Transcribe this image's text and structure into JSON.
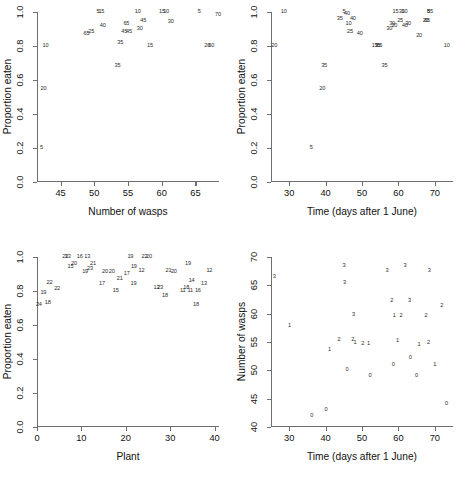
{
  "figure": {
    "panel_count": 4,
    "background": "#ffffff",
    "axis_color": "#6e6e6e",
    "text_color": "#111111",
    "marker_color": "#2b2b2b"
  },
  "chart_data": [
    {
      "id": "panel-1",
      "type": "scatter",
      "title": "",
      "xlabel": "Number of wasps",
      "ylabel": "Proportion eaten",
      "xlim": [
        41.5,
        68.5
      ],
      "ylim": [
        0.0,
        1.0
      ],
      "xticks": [
        45,
        50,
        55,
        60,
        65
      ],
      "yticks": [
        "0.0",
        "0.2",
        "0.4",
        "0.6",
        "0.8",
        "1.0"
      ],
      "grid": false,
      "legend": "none",
      "marker_style": "text-label",
      "note": "each point is drawn as its text label (plant/time code)",
      "points": [
        {
          "x": 42.0,
          "y": 0.2,
          "label": "5"
        },
        {
          "x": 42.3,
          "y": 0.55,
          "label": "20"
        },
        {
          "x": 42.6,
          "y": 0.8,
          "label": "10"
        },
        {
          "x": 48.7,
          "y": 0.87,
          "label": "65"
        },
        {
          "x": 49.4,
          "y": 0.88,
          "label": "25"
        },
        {
          "x": 50.4,
          "y": 1.0,
          "label": "5"
        },
        {
          "x": 50.9,
          "y": 1.0,
          "label": "15"
        },
        {
          "x": 51.1,
          "y": 0.92,
          "label": "40"
        },
        {
          "x": 53.3,
          "y": 0.68,
          "label": "35"
        },
        {
          "x": 53.7,
          "y": 0.82,
          "label": "35"
        },
        {
          "x": 54.3,
          "y": 0.88,
          "label": "45"
        },
        {
          "x": 54.6,
          "y": 0.93,
          "label": "65"
        },
        {
          "x": 55.0,
          "y": 0.88,
          "label": "45"
        },
        {
          "x": 56.3,
          "y": 1.0,
          "label": "10"
        },
        {
          "x": 56.6,
          "y": 0.9,
          "label": "30"
        },
        {
          "x": 57.1,
          "y": 0.95,
          "label": "45"
        },
        {
          "x": 58.1,
          "y": 0.8,
          "label": "15"
        },
        {
          "x": 59.9,
          "y": 1.0,
          "label": "15"
        },
        {
          "x": 60.5,
          "y": 1.0,
          "label": "10"
        },
        {
          "x": 61.2,
          "y": 0.94,
          "label": "30"
        },
        {
          "x": 65.4,
          "y": 1.0,
          "label": "5"
        },
        {
          "x": 66.6,
          "y": 0.8,
          "label": "20"
        },
        {
          "x": 67.2,
          "y": 0.8,
          "label": "60"
        },
        {
          "x": 68.2,
          "y": 0.98,
          "label": "70"
        }
      ]
    },
    {
      "id": "panel-2",
      "type": "scatter",
      "title": "",
      "xlabel": "Time (days after 1 June)",
      "ylabel": "Proportion eaten",
      "xlim": [
        25,
        75
      ],
      "ylim": [
        0.0,
        1.0
      ],
      "xticks": [
        30,
        40,
        50,
        60,
        70
      ],
      "yticks": [
        "0.0",
        "0.2",
        "0.4",
        "0.6",
        "0.8",
        "1.0"
      ],
      "grid": false,
      "legend": "none",
      "marker_style": "text-label",
      "points": [
        {
          "x": 25.6,
          "y": 0.8,
          "label": "20"
        },
        {
          "x": 28.2,
          "y": 1.0,
          "label": "10"
        },
        {
          "x": 35.8,
          "y": 0.2,
          "label": "5"
        },
        {
          "x": 38.8,
          "y": 0.55,
          "label": "20"
        },
        {
          "x": 39.3,
          "y": 0.68,
          "label": "35"
        },
        {
          "x": 43.6,
          "y": 0.96,
          "label": "35"
        },
        {
          "x": 44.8,
          "y": 1.0,
          "label": "5"
        },
        {
          "x": 45.6,
          "y": 0.99,
          "label": "40"
        },
        {
          "x": 46.0,
          "y": 0.93,
          "label": "10"
        },
        {
          "x": 46.4,
          "y": 0.88,
          "label": "25"
        },
        {
          "x": 47.2,
          "y": 0.96,
          "label": "40"
        },
        {
          "x": 49.1,
          "y": 0.87,
          "label": "40"
        },
        {
          "x": 53.2,
          "y": 0.8,
          "label": "15"
        },
        {
          "x": 54.0,
          "y": 0.8,
          "label": "35"
        },
        {
          "x": 54.5,
          "y": 0.8,
          "label": "65"
        },
        {
          "x": 55.9,
          "y": 0.68,
          "label": "35"
        },
        {
          "x": 57.2,
          "y": 0.9,
          "label": "30"
        },
        {
          "x": 58.0,
          "y": 0.93,
          "label": "30"
        },
        {
          "x": 58.6,
          "y": 0.92,
          "label": "20"
        },
        {
          "x": 58.9,
          "y": 1.0,
          "label": "15"
        },
        {
          "x": 60.2,
          "y": 0.95,
          "label": "25"
        },
        {
          "x": 60.6,
          "y": 1.0,
          "label": "30"
        },
        {
          "x": 61.4,
          "y": 1.0,
          "label": "10"
        },
        {
          "x": 61.5,
          "y": 0.92,
          "label": "40"
        },
        {
          "x": 62.4,
          "y": 0.93,
          "label": "30"
        },
        {
          "x": 65.4,
          "y": 0.86,
          "label": "20"
        },
        {
          "x": 67.2,
          "y": 0.95,
          "label": "20"
        },
        {
          "x": 67.6,
          "y": 0.95,
          "label": "65"
        },
        {
          "x": 68.0,
          "y": 1.0,
          "label": "5"
        },
        {
          "x": 68.4,
          "y": 1.0,
          "label": "85"
        },
        {
          "x": 73.0,
          "y": 0.8,
          "label": "10"
        }
      ]
    },
    {
      "id": "panel-3",
      "type": "scatter",
      "title": "",
      "xlabel": "Plant",
      "ylabel": "Proportion eaten",
      "xlim": [
        0,
        41
      ],
      "ylim": [
        0.0,
        1.0
      ],
      "xticks": [
        0,
        10,
        20,
        30,
        40
      ],
      "yticks": [
        "0.0",
        "0.2",
        "0.4",
        "0.6",
        "0.8",
        "1.0"
      ],
      "grid": false,
      "legend": "none",
      "marker_style": "text-label",
      "points": [
        {
          "x": 0.2,
          "y": 0.72,
          "label": "24"
        },
        {
          "x": 1.2,
          "y": 0.79,
          "label": "19"
        },
        {
          "x": 2.2,
          "y": 0.73,
          "label": "18"
        },
        {
          "x": 2.6,
          "y": 0.85,
          "label": "22"
        },
        {
          "x": 4.3,
          "y": 0.81,
          "label": "22"
        },
        {
          "x": 6.1,
          "y": 1.0,
          "label": "23"
        },
        {
          "x": 6.7,
          "y": 1.0,
          "label": "13"
        },
        {
          "x": 7.3,
          "y": 0.94,
          "label": "15"
        },
        {
          "x": 8.1,
          "y": 0.96,
          "label": "20"
        },
        {
          "x": 9.4,
          "y": 1.0,
          "label": "16"
        },
        {
          "x": 11.1,
          "y": 1.0,
          "label": "13"
        },
        {
          "x": 10.6,
          "y": 0.91,
          "label": "19"
        },
        {
          "x": 11.7,
          "y": 0.93,
          "label": "23"
        },
        {
          "x": 12.4,
          "y": 0.96,
          "label": "21"
        },
        {
          "x": 14.4,
          "y": 0.84,
          "label": "17"
        },
        {
          "x": 15.1,
          "y": 0.91,
          "label": "20"
        },
        {
          "x": 16.6,
          "y": 0.91,
          "label": "20"
        },
        {
          "x": 17.5,
          "y": 0.8,
          "label": "15"
        },
        {
          "x": 18.4,
          "y": 0.87,
          "label": "21"
        },
        {
          "x": 20.0,
          "y": 0.9,
          "label": "17"
        },
        {
          "x": 20.8,
          "y": 1.0,
          "label": "19"
        },
        {
          "x": 21.6,
          "y": 0.94,
          "label": "19"
        },
        {
          "x": 21.5,
          "y": 0.84,
          "label": "19"
        },
        {
          "x": 23.3,
          "y": 0.92,
          "label": "12"
        },
        {
          "x": 24.0,
          "y": 1.0,
          "label": "22"
        },
        {
          "x": 25.0,
          "y": 1.0,
          "label": "20"
        },
        {
          "x": 26.7,
          "y": 0.82,
          "label": "12"
        },
        {
          "x": 27.5,
          "y": 0.82,
          "label": "23"
        },
        {
          "x": 28.6,
          "y": 0.77,
          "label": "18"
        },
        {
          "x": 29.4,
          "y": 0.92,
          "label": "21"
        },
        {
          "x": 30.6,
          "y": 0.91,
          "label": "20"
        },
        {
          "x": 32.6,
          "y": 0.8,
          "label": "11"
        },
        {
          "x": 33.4,
          "y": 0.82,
          "label": "18"
        },
        {
          "x": 33.8,
          "y": 0.96,
          "label": "19"
        },
        {
          "x": 34.3,
          "y": 0.8,
          "label": "11"
        },
        {
          "x": 34.6,
          "y": 0.86,
          "label": "14"
        },
        {
          "x": 35.6,
          "y": 0.72,
          "label": "18"
        },
        {
          "x": 36.0,
          "y": 0.8,
          "label": "16"
        },
        {
          "x": 37.4,
          "y": 0.84,
          "label": "13"
        },
        {
          "x": 38.6,
          "y": 0.92,
          "label": "12"
        }
      ]
    },
    {
      "id": "panel-4",
      "type": "scatter",
      "title": "",
      "xlabel": "Time (days after 1 June)",
      "ylabel": "Number of wasps",
      "xlim": [
        25,
        75
      ],
      "ylim": [
        40,
        70
      ],
      "xticks": [
        30,
        40,
        50,
        60,
        70
      ],
      "yticks": [
        40,
        45,
        50,
        55,
        60,
        65,
        70
      ],
      "grid": false,
      "legend": "none",
      "marker_style": "text-label",
      "note": "labels are replicate counts 0-3",
      "points": [
        {
          "x": 25.6,
          "y": 66.5,
          "label": "3"
        },
        {
          "x": 29.8,
          "y": 57.8,
          "label": "1"
        },
        {
          "x": 35.9,
          "y": 42.0,
          "label": "0"
        },
        {
          "x": 39.8,
          "y": 43.0,
          "label": "0"
        },
        {
          "x": 40.8,
          "y": 53.6,
          "label": "1"
        },
        {
          "x": 43.4,
          "y": 55.4,
          "label": "2"
        },
        {
          "x": 44.8,
          "y": 68.5,
          "label": "3"
        },
        {
          "x": 44.9,
          "y": 65.4,
          "label": "3"
        },
        {
          "x": 45.6,
          "y": 50.0,
          "label": "0"
        },
        {
          "x": 47.2,
          "y": 55.3,
          "label": "2"
        },
        {
          "x": 47.8,
          "y": 54.8,
          "label": "1"
        },
        {
          "x": 47.4,
          "y": 59.7,
          "label": "3"
        },
        {
          "x": 49.9,
          "y": 54.6,
          "label": "2"
        },
        {
          "x": 51.5,
          "y": 54.6,
          "label": "1"
        },
        {
          "x": 51.9,
          "y": 49.0,
          "label": "0"
        },
        {
          "x": 56.6,
          "y": 67.5,
          "label": "3"
        },
        {
          "x": 57.9,
          "y": 62.3,
          "label": "2"
        },
        {
          "x": 58.3,
          "y": 51.0,
          "label": "0"
        },
        {
          "x": 58.6,
          "y": 59.6,
          "label": "1"
        },
        {
          "x": 59.5,
          "y": 55.2,
          "label": "1"
        },
        {
          "x": 60.4,
          "y": 59.6,
          "label": "2"
        },
        {
          "x": 61.5,
          "y": 68.5,
          "label": "3"
        },
        {
          "x": 62.8,
          "y": 62.2,
          "label": "3"
        },
        {
          "x": 63.0,
          "y": 52.2,
          "label": "0"
        },
        {
          "x": 64.7,
          "y": 49.0,
          "label": "0"
        },
        {
          "x": 65.4,
          "y": 54.5,
          "label": "1"
        },
        {
          "x": 68.2,
          "y": 67.5,
          "label": "3"
        },
        {
          "x": 67.3,
          "y": 59.6,
          "label": "2"
        },
        {
          "x": 68.0,
          "y": 54.8,
          "label": "2"
        },
        {
          "x": 69.7,
          "y": 51.0,
          "label": "1"
        },
        {
          "x": 71.6,
          "y": 61.4,
          "label": "2"
        },
        {
          "x": 72.9,
          "y": 44.0,
          "label": "0"
        }
      ]
    }
  ]
}
